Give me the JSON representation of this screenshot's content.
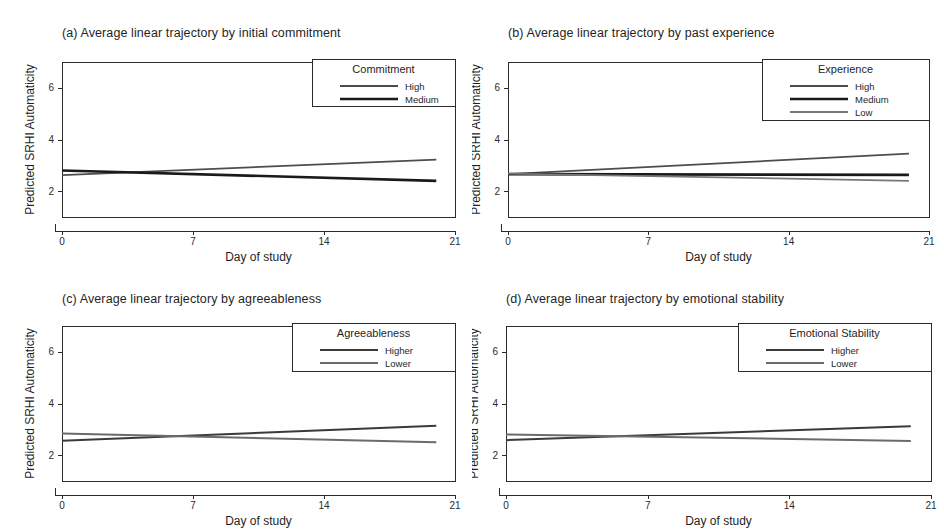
{
  "figure": {
    "background": "#ffffff",
    "width": 944,
    "height": 531
  },
  "common": {
    "xlabel": "Day of study",
    "ylabel": "Predicted SRHI Automaticity",
    "xticks": [
      "0",
      "7",
      "14",
      "21"
    ],
    "yticks": [
      "2",
      "4",
      "6"
    ]
  },
  "panels": {
    "a": {
      "title": "(a) Average linear trajectory by initial commitment",
      "legend_title": "Commitment",
      "series": [
        {
          "name": "High",
          "label": "High",
          "color": "#4d4d4d",
          "width": 1.8
        },
        {
          "name": "Medium",
          "label": "Medium",
          "color": "#1a1a1a",
          "width": 2.6
        }
      ]
    },
    "b": {
      "title": "(b) Average linear trajectory by past experience",
      "legend_title": "Experience",
      "series": [
        {
          "name": "High",
          "label": "High",
          "color": "#4d4d4d",
          "width": 1.8
        },
        {
          "name": "Medium",
          "label": "Medium",
          "color": "#1a1a1a",
          "width": 2.6
        },
        {
          "name": "Low",
          "label": "Low",
          "color": "#777777",
          "width": 1.8
        }
      ]
    },
    "c": {
      "title": "(c) Average linear trajectory by agreeableness",
      "legend_title": "Agreeableness",
      "series": [
        {
          "name": "Higher",
          "label": "Higher",
          "color": "#3a3a3a",
          "width": 2.0
        },
        {
          "name": "Lower",
          "label": "Lower",
          "color": "#6b6b6b",
          "width": 2.0
        }
      ]
    },
    "d": {
      "title": "(d) Average linear trajectory by emotional stability",
      "legend_title": "Emotional Stability",
      "series": [
        {
          "name": "Higher",
          "label": "Higher",
          "color": "#3a3a3a",
          "width": 2.0
        },
        {
          "name": "Lower",
          "label": "Lower",
          "color": "#6b6b6b",
          "width": 2.0
        }
      ]
    }
  },
  "chart_data": [
    {
      "type": "line",
      "panel": "a",
      "title": "(a) Average linear trajectory by initial commitment",
      "xlabel": "Day of study",
      "ylabel": "Predicted SRHI Automaticity",
      "xlim": [
        0,
        21
      ],
      "ylim": [
        1,
        7
      ],
      "xticks": [
        0,
        7,
        14,
        21
      ],
      "yticks": [
        2,
        4,
        6
      ],
      "grid": false,
      "legend": {
        "title": "Commitment",
        "position": "top-right"
      },
      "x": [
        0,
        20
      ],
      "series": [
        {
          "name": "High",
          "values": [
            2.62,
            3.22
          ]
        },
        {
          "name": "Medium",
          "values": [
            2.8,
            2.4
          ]
        }
      ]
    },
    {
      "type": "line",
      "panel": "b",
      "title": "(b) Average linear trajectory by past experience",
      "xlabel": "Day of study",
      "ylabel": "Predicted SRHI Automaticity",
      "xlim": [
        0,
        21
      ],
      "ylim": [
        1,
        7
      ],
      "xticks": [
        0,
        7,
        14,
        21
      ],
      "yticks": [
        2,
        4,
        6
      ],
      "grid": false,
      "legend": {
        "title": "Experience",
        "position": "top-right"
      },
      "x": [
        0,
        20
      ],
      "series": [
        {
          "name": "High",
          "values": [
            2.66,
            3.45
          ]
        },
        {
          "name": "Medium",
          "values": [
            2.66,
            2.63
          ]
        },
        {
          "name": "Low",
          "values": [
            2.68,
            2.4
          ]
        }
      ]
    },
    {
      "type": "line",
      "panel": "c",
      "title": "(c) Average linear trajectory by agreeableness",
      "xlabel": "Day of study",
      "ylabel": "Predicted SRHI Automaticity",
      "xlim": [
        0,
        21
      ],
      "ylim": [
        1,
        7
      ],
      "xticks": [
        0,
        7,
        14,
        21
      ],
      "yticks": [
        2,
        4,
        6
      ],
      "grid": false,
      "legend": {
        "title": "Agreeableness",
        "position": "top-right"
      },
      "x": [
        0,
        20
      ],
      "series": [
        {
          "name": "Higher",
          "values": [
            2.56,
            3.14
          ]
        },
        {
          "name": "Lower",
          "values": [
            2.84,
            2.5
          ]
        }
      ]
    },
    {
      "type": "line",
      "panel": "d",
      "title": "(d) Average linear trajectory by emotional stability",
      "xlabel": "Day of study",
      "ylabel": "Predicted SRHI Automaticity",
      "xlim": [
        0,
        21
      ],
      "ylim": [
        1,
        7
      ],
      "xticks": [
        0,
        7,
        14,
        21
      ],
      "yticks": [
        2,
        4,
        6
      ],
      "grid": false,
      "legend": {
        "title": "Emotional Stability",
        "position": "top-right"
      },
      "x": [
        0,
        20
      ],
      "series": [
        {
          "name": "Higher",
          "values": [
            2.58,
            3.12
          ]
        },
        {
          "name": "Lower",
          "values": [
            2.8,
            2.55
          ]
        }
      ]
    }
  ]
}
